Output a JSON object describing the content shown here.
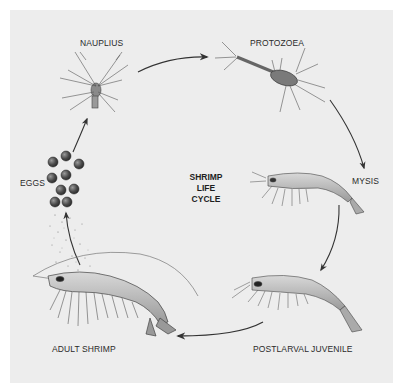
{
  "title": {
    "lines": [
      "SHRIMP",
      "LIFE",
      "CYCLE"
    ]
  },
  "stages": [
    {
      "id": "eggs",
      "label": "EGGS"
    },
    {
      "id": "nauplius",
      "label": "NAUPLIUS"
    },
    {
      "id": "protozoea",
      "label": "PROTOZOEA"
    },
    {
      "id": "mysis",
      "label": "MYSIS"
    },
    {
      "id": "postlarval_juvenile",
      "label": "POSTLARVAL JUVENILE"
    },
    {
      "id": "adult_shrimp",
      "label": "ADULT SHRIMP"
    }
  ],
  "cycle_order": [
    "eggs",
    "nauplius",
    "protozoea",
    "mysis",
    "postlarval_juvenile",
    "adult_shrimp",
    "eggs"
  ],
  "colors": {
    "panel": "#ededed",
    "ink": "#2a2a2a",
    "arrow": "#333333",
    "egg": "#4a4a4a"
  }
}
